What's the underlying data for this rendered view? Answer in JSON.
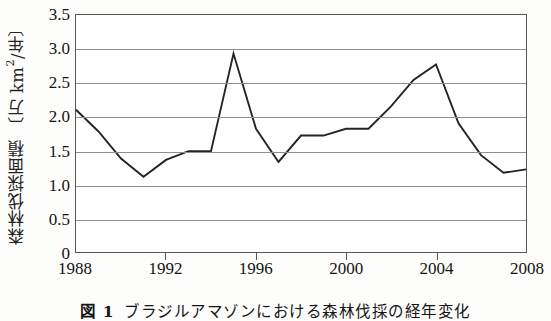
{
  "figure": {
    "caption_number": "図 1",
    "caption_text": "ブラジルアマゾンにおける森林伐採の経年変化",
    "axis_color": "#55565a",
    "grid_color": "#8d8f93",
    "line_color": "#242424",
    "background": "#ffffff"
  },
  "chart_data": {
    "type": "line",
    "title": "",
    "xlabel": "",
    "ylabel": "森林伐採面積 〔万 km2/年〕",
    "ylabel_parts": {
      "prefix": "森林伐採面積 〔万 km",
      "superscript": "2",
      "suffix": "/年〕"
    },
    "x": [
      1988,
      1989,
      1990,
      1991,
      1992,
      1993,
      1994,
      1995,
      1996,
      1997,
      1998,
      1999,
      2000,
      2001,
      2002,
      2003,
      2004,
      2005,
      2006,
      2007,
      2008
    ],
    "values": [
      2.1,
      1.78,
      1.38,
      1.11,
      1.36,
      1.49,
      1.49,
      2.93,
      1.82,
      1.33,
      1.72,
      1.72,
      1.82,
      1.82,
      2.15,
      2.54,
      2.77,
      1.9,
      1.43,
      1.17,
      1.22
    ],
    "series": [
      {
        "name": "森林伐採面積",
        "values": [
          2.1,
          1.78,
          1.38,
          1.11,
          1.36,
          1.49,
          1.49,
          2.93,
          1.82,
          1.33,
          1.72,
          1.72,
          1.82,
          1.82,
          2.15,
          2.54,
          2.77,
          1.9,
          1.43,
          1.17,
          1.22
        ]
      }
    ],
    "xlim": [
      1988,
      2008
    ],
    "ylim": [
      0,
      3.5
    ],
    "ytick_values": [
      0,
      0.5,
      1.0,
      1.5,
      2.0,
      2.5,
      3.0,
      3.5
    ],
    "ytick_labels": [
      "0",
      "0.5",
      "1.0",
      "1.5",
      "2.0",
      "2.5",
      "3.0",
      "3.5"
    ],
    "xtick_values": [
      1988,
      1992,
      1996,
      2000,
      2004,
      2008
    ],
    "xtick_labels": [
      "1988",
      "1992",
      "1996",
      "2000",
      "2004",
      "2008"
    ],
    "grid": "horizontal",
    "legend": "none",
    "markers": "none"
  }
}
